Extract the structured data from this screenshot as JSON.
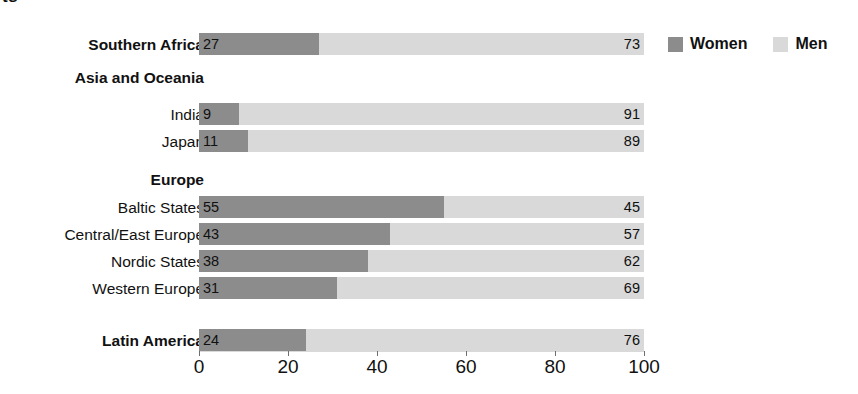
{
  "clipped_title_fragment": "ts",
  "legend": {
    "position": "top-right",
    "items": [
      {
        "label": "Women",
        "color": "#8c8c8c",
        "swatch_icon": "square-swatch-icon"
      },
      {
        "label": "Men",
        "color": "#d9d9d9",
        "swatch_icon": "square-swatch-icon"
      }
    ]
  },
  "axis": {
    "ticks": [
      "0",
      "20",
      "40",
      "60",
      "80",
      "100"
    ],
    "tick_values": [
      0,
      20,
      40,
      60,
      80,
      100
    ],
    "min": 0,
    "max": 100
  },
  "rows": [
    {
      "type": "bar",
      "label": "Southern Africa",
      "bold": true,
      "women": 27,
      "men": 73,
      "top": 33
    },
    {
      "type": "heading",
      "label": "Asia and Oceania",
      "bold": true,
      "top": 68
    },
    {
      "type": "bar",
      "label": "India",
      "bold": false,
      "women": 9,
      "men": 91,
      "top": 103
    },
    {
      "type": "bar",
      "label": "Japan",
      "bold": false,
      "women": 11,
      "men": 89,
      "top": 130
    },
    {
      "type": "heading",
      "label": "Europe",
      "bold": true,
      "top": 170
    },
    {
      "type": "bar",
      "label": "Baltic States",
      "bold": false,
      "women": 55,
      "men": 45,
      "top": 196
    },
    {
      "type": "bar",
      "label": "Central/East Europe",
      "bold": false,
      "women": 43,
      "men": 57,
      "top": 223
    },
    {
      "type": "bar",
      "label": "Nordic States",
      "bold": false,
      "women": 38,
      "men": 62,
      "top": 250
    },
    {
      "type": "bar",
      "label": "Western Europe",
      "bold": false,
      "women": 31,
      "men": 69,
      "top": 277
    },
    {
      "type": "bar",
      "label": "Latin America",
      "bold": true,
      "women": 24,
      "men": 76,
      "top": 329
    }
  ],
  "chart_data": {
    "type": "bar",
    "orientation": "horizontal",
    "stacked": true,
    "normalized_percent": true,
    "title": "",
    "subtitle": "",
    "xlabel": "",
    "ylabel": "",
    "xlim": [
      0,
      100
    ],
    "xticks": [
      0,
      20,
      40,
      60,
      80,
      100
    ],
    "grid": false,
    "legend_position": "top-right",
    "categories": [
      "Southern Africa",
      "India",
      "Japan",
      "Baltic States",
      "Central/East Europe",
      "Nordic States",
      "Western Europe",
      "Latin America"
    ],
    "category_groups": [
      {
        "group": "Southern Africa",
        "members": [
          "Southern Africa"
        ]
      },
      {
        "group": "Asia and Oceania",
        "members": [
          "India",
          "Japan"
        ]
      },
      {
        "group": "Europe",
        "members": [
          "Baltic States",
          "Central/East Europe",
          "Nordic States",
          "Western Europe"
        ]
      },
      {
        "group": "Latin America",
        "members": [
          "Latin America"
        ]
      }
    ],
    "series": [
      {
        "name": "Women",
        "color": "#8c8c8c",
        "values": [
          27,
          9,
          11,
          55,
          43,
          38,
          31,
          24
        ]
      },
      {
        "name": "Men",
        "color": "#d9d9d9",
        "values": [
          73,
          91,
          89,
          45,
          57,
          62,
          69,
          76
        ]
      }
    ],
    "data_labels": {
      "Women": [
        "27",
        "9",
        "11",
        "55",
        "43",
        "38",
        "31",
        "24"
      ],
      "Men": [
        "73",
        "91",
        "89",
        "45",
        "57",
        "62",
        "69",
        "76"
      ]
    }
  }
}
